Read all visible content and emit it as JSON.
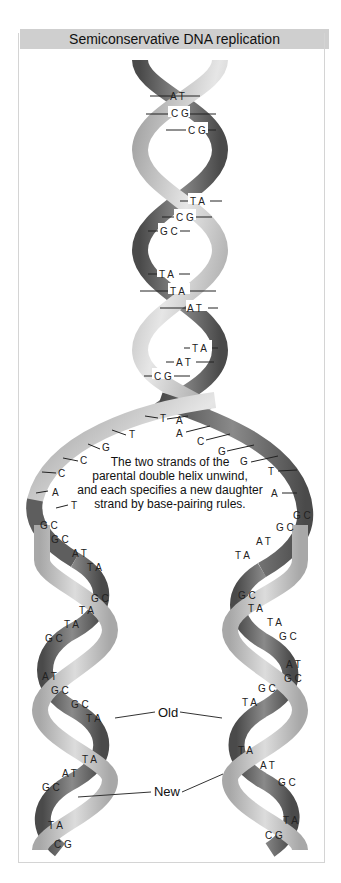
{
  "title": "Semiconservative DNA replication",
  "caption": {
    "lines": [
      "The two strands of the",
      "parental double helix unwind,",
      "and each specifies a new daughter",
      "strand by base-pairing rules."
    ]
  },
  "labels": {
    "old": "Old",
    "new": "New"
  },
  "parental_helix": {
    "base_pairs": [
      "A T",
      "C G",
      "C G",
      "T A",
      "C G",
      "G C",
      "T A",
      "T A",
      "A T",
      "T A",
      "A T",
      "C G"
    ]
  },
  "fork": {
    "left_strand_bases": [
      "T",
      "T",
      "G",
      "C",
      "C",
      "A",
      "T"
    ],
    "right_strand_bases": [
      "A",
      "A",
      "C",
      "G",
      "G",
      "T",
      "A"
    ]
  },
  "left_daughter": {
    "base_pairs": [
      "G C",
      "G C",
      "A T",
      "T A",
      "G C",
      "T A",
      "T A",
      "G C",
      "A T",
      "G C",
      "G C",
      "T A",
      "T A",
      "A T",
      "G C",
      "T A",
      "C G"
    ]
  },
  "right_daughter": {
    "base_pairs": [
      "G C",
      "G C",
      "A T",
      "T A",
      "G C",
      "T A",
      "T A",
      "G C",
      "A T",
      "G C",
      "G C",
      "T A",
      "T A",
      "A T",
      "G C",
      "T A",
      "C G"
    ]
  },
  "colors": {
    "old_strand_dark": "#5a5a5a",
    "old_strand_light": "#bdbdbd",
    "new_strand": "#b5b5b5",
    "title_bg": "#cfcfcf"
  }
}
